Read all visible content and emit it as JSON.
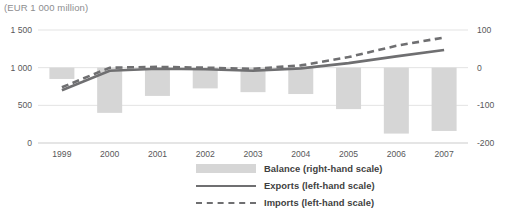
{
  "chart_data": {
    "type": "bar",
    "title": "(EUR 1 000 million)",
    "xlabel": "",
    "ylabel": "",
    "categories": [
      "1999",
      "2000",
      "2001",
      "2002",
      "2003",
      "2004",
      "2005",
      "2006",
      "2007"
    ],
    "grid": true,
    "legend_position": "bottom",
    "left_axis": {
      "label": "left-hand scale",
      "ticks": [
        "0",
        "500",
        "1 000",
        "1 500"
      ],
      "tick_values": [
        0,
        500,
        1000,
        1500
      ],
      "ylim": [
        0,
        1500
      ]
    },
    "right_axis": {
      "label": "right-hand scale",
      "ticks": [
        "-200",
        "-100",
        "0",
        "100"
      ],
      "tick_values": [
        -200,
        -100,
        0,
        100
      ],
      "ylim": [
        -200,
        100
      ]
    },
    "series": [
      {
        "name": "Balance (right-hand scale)",
        "type": "bar",
        "axis": "right",
        "color": "#d6d6d6",
        "values": [
          -30,
          -120,
          -75,
          -55,
          -65,
          -70,
          -110,
          -175,
          -168
        ]
      },
      {
        "name": "Exports (left-hand scale)",
        "type": "line",
        "style": "solid",
        "axis": "left",
        "color": "#6f6f71",
        "values": [
          700,
          960,
          985,
          980,
          960,
          990,
          1060,
          1150,
          1235
        ]
      },
      {
        "name": "Imports (left-hand scale)",
        "type": "line",
        "style": "dashed",
        "axis": "left",
        "color": "#6f6f71",
        "values": [
          740,
          1000,
          1010,
          1000,
          985,
          1030,
          1140,
          1290,
          1400
        ]
      }
    ]
  },
  "legend": [
    {
      "label": "Balance (right-hand scale)",
      "marker": "bar"
    },
    {
      "label": "Exports (left-hand scale)",
      "marker": "line"
    },
    {
      "label": "Imports (left-hand scale)",
      "marker": "dash"
    }
  ]
}
